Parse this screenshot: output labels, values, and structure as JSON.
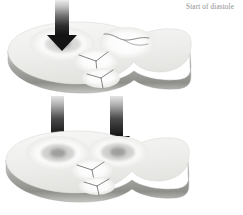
{
  "figure": {
    "caption": "Start of diastole",
    "title_label": "cardiac-valve-plane-diastole-diagram",
    "background_color": "#ffffff",
    "caption_color": "#8d8d8d",
    "disc_top_color": "#f2f2f1",
    "disc_rim_color": "#9a9a9a",
    "disc_shadow_color": "#c9c9c7",
    "arrow_dark_color": "#1d1d1d",
    "arrow_light_color": "#d8d8d8",
    "valve_line_color": "#6f6f6f",
    "opening_color": "#fdfdfd",
    "discs": [
      {
        "name": "upper-valve-plane",
        "label": "Upper valve plane disc",
        "openings": [
          {
            "name": "mitral-opening",
            "state": "open",
            "flow": "inflow"
          },
          {
            "name": "aortic-opening",
            "state": "closed",
            "leaflet": "curved-line"
          },
          {
            "name": "tricuspid-leaflet-upper",
            "state": "closed",
            "leaflet": "y-shape"
          },
          {
            "name": "pulmonary-leaflet-lower",
            "state": "closed",
            "leaflet": "y-shape"
          }
        ],
        "arrows": [
          {
            "name": "inflow-arrow-top-left",
            "direction": "down",
            "length": "long"
          }
        ]
      },
      {
        "name": "lower-valve-plane",
        "label": "Lower valve plane disc",
        "openings": [
          {
            "name": "mitral-opening",
            "state": "open",
            "flow": "inflow"
          },
          {
            "name": "tricuspid-opening",
            "state": "open",
            "flow": "inflow"
          },
          {
            "name": "aortic-leaflet",
            "state": "closed",
            "leaflet": "y-shape"
          },
          {
            "name": "pulmonary-leaflet",
            "state": "closed",
            "leaflet": "y-shape"
          }
        ],
        "arrows": [
          {
            "name": "inflow-arrow-lower-left",
            "direction": "down",
            "length": "medium"
          },
          {
            "name": "inflow-arrow-lower-right",
            "direction": "down",
            "length": "medium"
          }
        ]
      }
    ]
  }
}
